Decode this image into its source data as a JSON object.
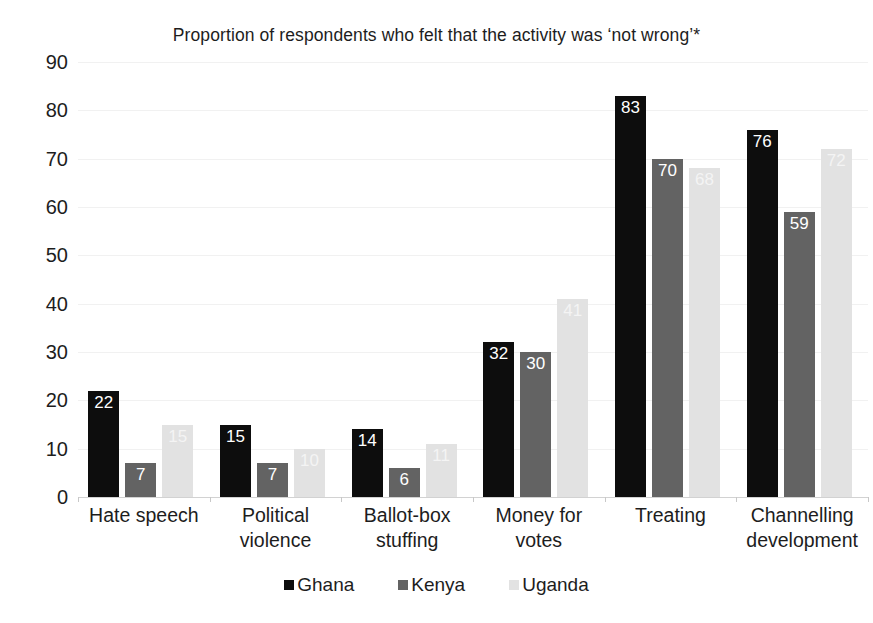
{
  "chart_data": {
    "type": "bar",
    "title": "Proportion of respondents who felt that the activity was ‘not wrong’*",
    "xlabel": "",
    "ylabel": "",
    "ylim": [
      0,
      90
    ],
    "yticks": [
      0,
      10,
      20,
      30,
      40,
      50,
      60,
      70,
      80,
      90
    ],
    "ytick_labels": [
      "0",
      "10",
      "20",
      "30",
      "40",
      "50",
      "60",
      "70",
      "80",
      "90"
    ],
    "grid": true,
    "legend_position": "bottom",
    "categories": [
      "Hate speech",
      "Political violence",
      "Ballot-box stuffing",
      "Money for votes",
      "Treating",
      "Channelling development"
    ],
    "category_lines": [
      [
        "Hate speech"
      ],
      [
        "Political",
        "violence"
      ],
      [
        "Ballot-box",
        "stuffing"
      ],
      [
        "Money for",
        "votes"
      ],
      [
        "Treating"
      ],
      [
        "Channelling",
        "development"
      ]
    ],
    "series": [
      {
        "name": "Ghana",
        "color": "#0d0d0d",
        "values": [
          22,
          15,
          14,
          32,
          83,
          76
        ]
      },
      {
        "name": "Kenya",
        "color": "#636363",
        "values": [
          7,
          7,
          6,
          30,
          70,
          59
        ]
      },
      {
        "name": "Uganda",
        "color": "#e2e2e2",
        "values": [
          15,
          10,
          11,
          41,
          68,
          72
        ]
      }
    ],
    "data_labels": [
      {
        "category": "Hate speech",
        "Ghana": "22",
        "Kenya": "7",
        "Uganda": "15"
      },
      {
        "category": "Political violence",
        "Ghana": "15",
        "Kenya": "7",
        "Uganda": "10"
      },
      {
        "category": "Ballot-box stuffing",
        "Ghana": "14",
        "Kenya": "6",
        "Uganda": "11"
      },
      {
        "category": "Money for votes",
        "Ghana": "32",
        "Kenya": "30",
        "Uganda": "41"
      },
      {
        "category": "Treating",
        "Ghana": "83",
        "Kenya": "70",
        "Uganda": "68"
      },
      {
        "category": "Channelling development",
        "Ghana": "76",
        "Kenya": "59",
        "Uganda": "72"
      }
    ]
  },
  "legend": {
    "items": [
      {
        "label": "Ghana",
        "swatch": "ghana"
      },
      {
        "label": "Kenya",
        "swatch": "kenya"
      },
      {
        "label": "Uganda",
        "swatch": "uganda"
      }
    ]
  }
}
